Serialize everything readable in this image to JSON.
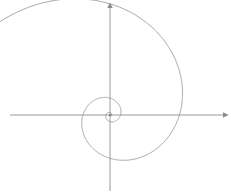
{
  "figure": {
    "title": "",
    "background_color": "#ffffff",
    "line_color": "#9a9a9a",
    "axis_color": "#9a9a9a"
  },
  "chart_data": {
    "type": "line",
    "title": "",
    "subtitle": "",
    "xlabel": "",
    "ylabel": "",
    "curve_name": "logarithmic-spiral",
    "equation": "r = a * e^(b * theta)",
    "parameters": {
      "a": 1.6,
      "b": 0.3,
      "theta_start": -1.2,
      "theta_end": 15.4,
      "direction": "counterclockwise"
    },
    "origin_px": [
      110,
      115
    ],
    "pixels_per_unit": 1,
    "grid": false,
    "legend": false,
    "axes": {
      "x_axis": {
        "y_px": 115,
        "x_start_px": 10,
        "x_end_px": 225,
        "arrow": "right",
        "tick_labels": []
      },
      "y_axis": {
        "x_px": 110,
        "y_start_px": 190,
        "y_end_px": 5,
        "arrow": "up",
        "tick_labels": []
      }
    },
    "axis_crossings": {
      "positive_x_radii": [
        1.6,
        3.6,
        14,
        44,
        97
      ],
      "negative_x_radii": [
        2.4,
        6.2,
        15,
        42,
        79
      ],
      "positive_y_radii": [
        2.0,
        4.8,
        18,
        48,
        92
      ],
      "negative_y_radii": [
        1.3,
        3.0,
        13,
        32,
        61
      ]
    },
    "series": [
      {
        "name": "spiral",
        "values": []
      }
    ]
  }
}
